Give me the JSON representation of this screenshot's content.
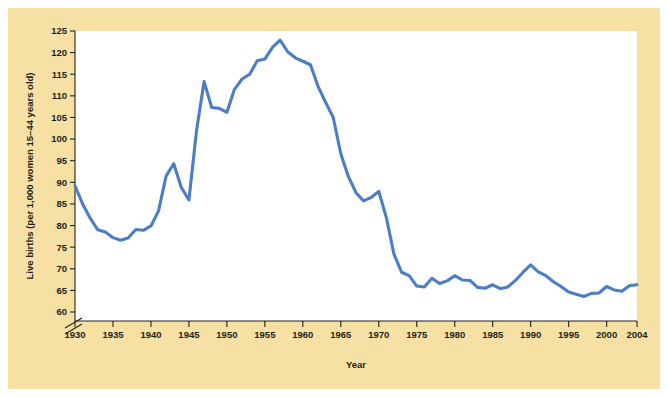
{
  "figure": {
    "panel_color": "#f7e0a4",
    "plot_background": "#ffffff",
    "outer_background": "#ffffff",
    "axis_color": "#231f1a"
  },
  "chart_data": {
    "type": "line",
    "title": "",
    "xlabel": "Year",
    "ylabel": "Live births (per 1,000 women 15–44 years old)",
    "xlim": [
      1930,
      2004
    ],
    "ylim": [
      58,
      125
    ],
    "yaxis_break": true,
    "grid": false,
    "legend": null,
    "line_color": "#4d7ec4",
    "xticks": [
      1930,
      1935,
      1940,
      1945,
      1950,
      1955,
      1960,
      1965,
      1970,
      1975,
      1980,
      1985,
      1990,
      1995,
      2000,
      2004
    ],
    "xtick_labels": [
      "1930",
      "1935",
      "1940",
      "1945",
      "1950",
      "1955",
      "1960",
      "1965",
      "1970",
      "1975",
      "1980",
      "1985",
      "1990",
      "1995",
      "2000",
      "2004"
    ],
    "yticks": [
      60,
      65,
      70,
      75,
      80,
      85,
      90,
      95,
      100,
      105,
      110,
      115,
      120,
      125
    ],
    "ytick_labels": [
      "60",
      "65",
      "70",
      "75",
      "80",
      "85",
      "90",
      "95",
      "100",
      "105",
      "110",
      "115",
      "120",
      "125"
    ],
    "series": [
      {
        "name": "Live births per 1,000 women aged 15-44",
        "x": [
          1930,
          1931,
          1932,
          1933,
          1934,
          1935,
          1936,
          1937,
          1938,
          1939,
          1940,
          1941,
          1942,
          1943,
          1944,
          1945,
          1946,
          1947,
          1948,
          1949,
          1950,
          1951,
          1952,
          1953,
          1954,
          1955,
          1956,
          1957,
          1958,
          1959,
          1960,
          1961,
          1962,
          1963,
          1964,
          1965,
          1966,
          1967,
          1968,
          1969,
          1970,
          1971,
          1972,
          1973,
          1974,
          1975,
          1976,
          1977,
          1978,
          1979,
          1980,
          1981,
          1982,
          1983,
          1984,
          1985,
          1986,
          1987,
          1988,
          1989,
          1990,
          1991,
          1992,
          1993,
          1994,
          1995,
          1996,
          1997,
          1998,
          1999,
          2000,
          2001,
          2002,
          2003,
          2004
        ],
        "y": [
          89.2,
          85.0,
          81.7,
          79.0,
          78.5,
          77.2,
          76.6,
          77.1,
          79.1,
          78.9,
          79.9,
          83.4,
          91.5,
          94.3,
          88.8,
          85.9,
          101.9,
          113.3,
          107.3,
          107.1,
          106.2,
          111.5,
          113.9,
          115.0,
          118.1,
          118.5,
          121.2,
          122.9,
          120.2,
          118.8,
          118.0,
          117.2,
          112.2,
          108.5,
          105.0,
          96.6,
          91.3,
          87.6,
          85.7,
          86.5,
          87.9,
          81.8,
          73.4,
          69.2,
          68.4,
          66.0,
          65.8,
          67.8,
          66.6,
          67.2,
          68.4,
          67.4,
          67.3,
          65.7,
          65.5,
          66.3,
          65.4,
          65.8,
          67.3,
          69.2,
          70.9,
          69.3,
          68.4,
          67.0,
          65.9,
          64.6,
          64.1,
          63.6,
          64.3,
          64.4,
          65.9,
          65.1,
          64.8,
          66.1,
          66.3
        ]
      }
    ]
  }
}
